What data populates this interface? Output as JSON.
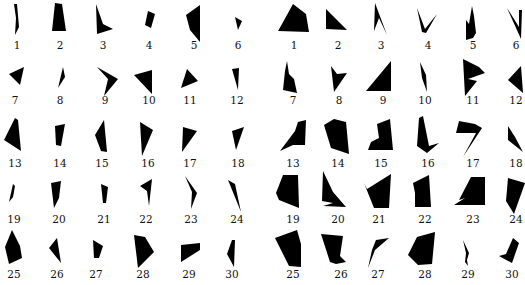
{
  "figure": {
    "fill_color": "#000000",
    "background": "#ffffff",
    "label_color": "#111111"
  },
  "panels": [
    {
      "name": "left",
      "label_rows_y": [
        45,
        100,
        163,
        219,
        274
      ],
      "items": [
        {
          "label": "1",
          "cx": 17,
          "pts": "14,4 17,4 19,27 15,35 16,18"
        },
        {
          "label": "2",
          "cx": 60,
          "pts": "55,3 62,4 66,31 52,31"
        },
        {
          "label": "3",
          "cx": 103,
          "pts": "96,4 103,24 113,29 97,34"
        },
        {
          "label": "4",
          "cx": 149,
          "pts": "148,11 155,14 151,28 145,25"
        },
        {
          "label": "5",
          "cx": 194,
          "pts": "186,15 200,5 200,42 190,30"
        },
        {
          "label": "6",
          "cx": 238,
          "pts": "235,17 242,21 238,30"
        },
        {
          "label": "7",
          "cx": 15,
          "pts": "9,74 24,67 20,85"
        },
        {
          "label": "8",
          "cx": 60,
          "pts": "63,67 65,77 58,88"
        },
        {
          "label": "9",
          "cx": 105,
          "pts": "97,67 118,79 104,96 108,79"
        },
        {
          "label": "10",
          "cx": 149,
          "pts": "134,75 152,70 152,94"
        },
        {
          "label": "11",
          "cx": 190,
          "pts": "187,69 198,81 181,88"
        },
        {
          "label": "12",
          "cx": 237,
          "pts": "232,69 239,68 238,90"
        },
        {
          "label": "13",
          "cx": 15,
          "pts": "15,118 18,120 21,151 4,140"
        },
        {
          "label": "14",
          "cx": 60,
          "pts": "55,126 65,124 61,146 56,145"
        },
        {
          "label": "15",
          "cx": 102,
          "pts": "104,120 107,152 101,151 95,135"
        },
        {
          "label": "16",
          "cx": 148,
          "pts": "140,122 153,130 142,156"
        },
        {
          "label": "17",
          "cx": 190,
          "pts": "183,127 197,131 182,152"
        },
        {
          "label": "18",
          "cx": 238,
          "pts": "232,131 244,127 236,150"
        },
        {
          "label": "19",
          "cx": 14,
          "pts": "13,184 15,186 13,197 9,202"
        },
        {
          "label": "20",
          "cx": 59,
          "pts": "51,183 61,181 59,198 54,208"
        },
        {
          "label": "21",
          "cx": 104,
          "pts": "101,184 108,187 106,203 103,203"
        },
        {
          "label": "22",
          "cx": 146,
          "pts": "140,186 152,179 149,206 147,191"
        },
        {
          "label": "23",
          "cx": 191,
          "pts": "185,176 197,193 191,209 192,192"
        },
        {
          "label": "24",
          "cx": 237,
          "pts": "228,180 235,184 241,212"
        },
        {
          "label": "25",
          "cx": 14,
          "pts": "12,230 20,246 22,258 9,264 5,247"
        },
        {
          "label": "26",
          "cx": 57,
          "pts": "57,238 61,263 49,248"
        },
        {
          "label": "27",
          "cx": 96,
          "pts": "93,240 103,246 99,258 94,258"
        },
        {
          "label": "28",
          "cx": 143,
          "pts": "134,235 145,237 154,252 138,268"
        },
        {
          "label": "29",
          "cx": 189,
          "pts": "181,245 200,243 200,250 181,262"
        },
        {
          "label": "30",
          "cx": 232,
          "pts": "232,240 235,240 234,267 227,254"
        }
      ]
    },
    {
      "name": "right",
      "label_rows_y": [
        45,
        100,
        163,
        219,
        274
      ],
      "items": [
        {
          "label": "1",
          "cx": 31,
          "pts": "15,31 19,24 30,4 43,14 46,32"
        },
        {
          "label": "2",
          "cx": 75,
          "pts": "63,9 84,30 63,29"
        },
        {
          "label": "3",
          "cx": 118,
          "pts": "112,3 124,35 116,18 111,31"
        },
        {
          "label": "4",
          "cx": 165,
          "pts": "154,8 162,29 174,14 163,33 159,32"
        },
        {
          "label": "5",
          "cx": 210,
          "pts": "209,6 211,16 213,33 210,38 203,40 203,20 206,24"
        },
        {
          "label": "6",
          "cx": 253,
          "pts": "244,8 256,27 256,10 259,10 258,39"
        },
        {
          "label": "7",
          "cx": 30,
          "pts": "24,61 26,74 31,79 34,93 20,90 22,71"
        },
        {
          "label": "8",
          "cx": 76,
          "pts": "68,66 74,74 84,73 71,92"
        },
        {
          "label": "9",
          "cx": 120,
          "pts": "103,91 128,61 128,91"
        },
        {
          "label": "10",
          "cx": 162,
          "pts": "157,62 163,75 164,92 159,78"
        },
        {
          "label": "11",
          "cx": 210,
          "pts": "200,59 216,67 222,73 205,79 214,81 202,96"
        },
        {
          "label": "12",
          "cx": 253,
          "pts": "258,66 260,93 245,80"
        },
        {
          "label": "13",
          "cx": 30,
          "pts": "35,122 43,120 42,145 30,145 17,151 32,131"
        },
        {
          "label": "14",
          "cx": 75,
          "pts": "61,125 71,119 83,122 86,154 68,148"
        },
        {
          "label": "15",
          "cx": 118,
          "pts": "114,124 127,119 130,150 105,150 108,142 116,138"
        },
        {
          "label": "16",
          "cx": 165,
          "pts": "156,118 160,116 166,146 176,143 164,153 154,146"
        },
        {
          "label": "17",
          "cx": 210,
          "pts": "196,121 212,124 219,128 200,157 213,133 193,133"
        },
        {
          "label": "18",
          "cx": 253,
          "pts": "245,126 252,137 260,152 245,140"
        },
        {
          "label": "19",
          "cx": 30,
          "pts": "20,175 35,175 36,208 16,200 13,193"
        },
        {
          "label": "20",
          "cx": 75,
          "pts": "60,171 70,192 83,207 60,206 70,203 59,201"
        },
        {
          "label": "21",
          "cx": 116,
          "pts": "104,189 128,174 126,208 111,208 101,183"
        },
        {
          "label": "22",
          "cx": 162,
          "pts": "150,183 166,175 168,207 152,207 152,193"
        },
        {
          "label": "23",
          "cx": 210,
          "pts": "208,177 222,177 222,205 191,205 202,198 196,200"
        },
        {
          "label": "24",
          "cx": 253,
          "pts": "245,178 262,183 251,214 243,201"
        },
        {
          "label": "25",
          "cx": 30,
          "pts": "12,238 34,230 38,244 38,267 26,266"
        },
        {
          "label": "26",
          "cx": 78,
          "pts": "58,234 80,236 77,256 83,262 73,264 67,262"
        },
        {
          "label": "27",
          "cx": 115,
          "pts": "113,240 126,238 112,250 105,268 109,250"
        },
        {
          "label": "28",
          "cx": 162,
          "pts": "154,237 172,232 169,264 155,265 145,255"
        },
        {
          "label": "29",
          "cx": 205,
          "pts": "200,240 206,253 204,260 205,266 202,262 203,253"
        },
        {
          "label": "30",
          "cx": 249,
          "pts": "250,238 256,243 249,263 236,256 243,254"
        }
      ]
    }
  ]
}
